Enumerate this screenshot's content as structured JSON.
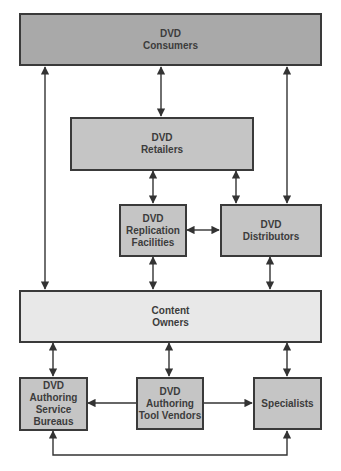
{
  "diagram": {
    "colors": {
      "dark_fill": "#a9a9a9",
      "mid_fill": "#c5c5c5",
      "light_fill": "#e8e8e8",
      "border": "#3a3a3a",
      "line": "#333333"
    },
    "nodes": {
      "consumers": {
        "line1": "DVD",
        "line2": "Consumers"
      },
      "retailers": {
        "line1": "DVD",
        "line2": "Retailers"
      },
      "replication": {
        "line1": "DVD",
        "line2": "Replication",
        "line3": "Facilities"
      },
      "distributors": {
        "line1": "DVD",
        "line2": "Distributors"
      },
      "content_owners": {
        "line1": "Content",
        "line2": "Owners"
      },
      "authoring_bureaus": {
        "line1": "DVD",
        "line2": "Authoring",
        "line3": "Service",
        "line4": "Bureaus"
      },
      "tool_vendors": {
        "line1": "DVD",
        "line2": "Authoring",
        "line3": "Tool Vendors"
      },
      "specialists": {
        "line1": "Specialists"
      }
    },
    "edges": [
      {
        "from": "consumers",
        "to": "retailers",
        "type": "bidirectional"
      },
      {
        "from": "consumers",
        "to": "content_owners",
        "type": "bidirectional"
      },
      {
        "from": "consumers",
        "to": "distributors",
        "type": "bidirectional"
      },
      {
        "from": "retailers",
        "to": "replication",
        "type": "bidirectional"
      },
      {
        "from": "retailers",
        "to": "distributors",
        "type": "bidirectional"
      },
      {
        "from": "replication",
        "to": "distributors",
        "type": "bidirectional"
      },
      {
        "from": "replication",
        "to": "content_owners",
        "type": "bidirectional"
      },
      {
        "from": "distributors",
        "to": "content_owners",
        "type": "bidirectional"
      },
      {
        "from": "content_owners",
        "to": "authoring_bureaus",
        "type": "bidirectional"
      },
      {
        "from": "content_owners",
        "to": "tool_vendors",
        "type": "bidirectional"
      },
      {
        "from": "content_owners",
        "to": "specialists",
        "type": "bidirectional"
      },
      {
        "from": "tool_vendors",
        "to": "authoring_bureaus",
        "type": "directed"
      },
      {
        "from": "tool_vendors",
        "to": "specialists",
        "type": "directed"
      },
      {
        "from": "authoring_bureaus",
        "to": "specialists",
        "type": "bidirectional"
      }
    ]
  }
}
